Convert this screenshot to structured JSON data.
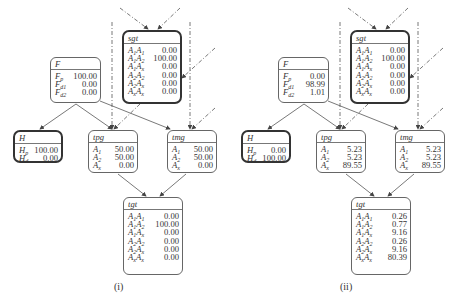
{
  "panels": [
    {
      "caption": "(i)",
      "nodes": {
        "sgt": {
          "title": "sgt",
          "rows": [
            {
              "k": "A",
              "s1": "1",
              "k2": "A",
              "s2": "1",
              "v": "0.00"
            },
            {
              "k": "A",
              "s1": "1",
              "k2": "A",
              "s2": "2",
              "v": "100.00"
            },
            {
              "k": "A",
              "s1": "1",
              "k2": "A",
              "s2": "x",
              "v": "0.00"
            },
            {
              "k": "A",
              "s1": "2",
              "k2": "A",
              "s2": "2",
              "v": "0.00"
            },
            {
              "k": "A",
              "s1": "2",
              "k2": "A",
              "s2": "x",
              "v": "0.00"
            },
            {
              "k": "A",
              "s1": "x",
              "k2": "A",
              "s2": "x",
              "v": "0.00"
            }
          ]
        },
        "F": {
          "title": "F",
          "rows": [
            {
              "k": "F",
              "s1": "p",
              "v": "100.00"
            },
            {
              "k": "F",
              "s1": "d1",
              "v": "0.00"
            },
            {
              "k": "F",
              "s1": "d2",
              "v": "0.00"
            }
          ]
        },
        "H": {
          "title": "H",
          "rows": [
            {
              "k": "H",
              "s1": "p",
              "v": "100.00"
            },
            {
              "k": "H",
              "s1": "d",
              "v": "0.00"
            }
          ]
        },
        "tpg": {
          "title": "tpg",
          "rows": [
            {
              "k": "A",
              "s1": "1",
              "v": "50.00"
            },
            {
              "k": "A",
              "s1": "2",
              "v": "50.00"
            },
            {
              "k": "A",
              "s1": "x",
              "v": "0.00"
            }
          ]
        },
        "tmg": {
          "title": "tmg",
          "rows": [
            {
              "k": "A",
              "s1": "1",
              "v": "50.00"
            },
            {
              "k": "A",
              "s1": "2",
              "v": "50.00"
            },
            {
              "k": "A",
              "s1": "x",
              "v": "0.00"
            }
          ]
        },
        "tgt": {
          "title": "tgt",
          "rows": [
            {
              "k": "A",
              "s1": "1",
              "k2": "A",
              "s2": "1",
              "v": "0.00"
            },
            {
              "k": "A",
              "s1": "1",
              "k2": "A",
              "s2": "2",
              "v": "100.00"
            },
            {
              "k": "A",
              "s1": "1",
              "k2": "A",
              "s2": "x",
              "v": "0.00"
            },
            {
              "k": "A",
              "s1": "2",
              "k2": "A",
              "s2": "2",
              "v": "0.00"
            },
            {
              "k": "A",
              "s1": "2",
              "k2": "A",
              "s2": "x",
              "v": "0.00"
            },
            {
              "k": "A",
              "s1": "x",
              "k2": "A",
              "s2": "x",
              "v": "0.00"
            }
          ]
        }
      }
    },
    {
      "caption": "(ii)",
      "nodes": {
        "sgt": {
          "title": "sgt",
          "rows": [
            {
              "k": "A",
              "s1": "1",
              "k2": "A",
              "s2": "1",
              "v": "0.00"
            },
            {
              "k": "A",
              "s1": "1",
              "k2": "A",
              "s2": "2",
              "v": "100.00"
            },
            {
              "k": "A",
              "s1": "1",
              "k2": "A",
              "s2": "x",
              "v": "0.00"
            },
            {
              "k": "A",
              "s1": "2",
              "k2": "A",
              "s2": "2",
              "v": "0.00"
            },
            {
              "k": "A",
              "s1": "2",
              "k2": "A",
              "s2": "x",
              "v": "0.00"
            },
            {
              "k": "A",
              "s1": "x",
              "k2": "A",
              "s2": "x",
              "v": "0.00"
            }
          ]
        },
        "F": {
          "title": "F",
          "rows": [
            {
              "k": "F",
              "s1": "p",
              "v": "0.00"
            },
            {
              "k": "F",
              "s1": "d1",
              "v": "98.99"
            },
            {
              "k": "F",
              "s1": "d2",
              "v": "1.01"
            }
          ]
        },
        "H": {
          "title": "H",
          "rows": [
            {
              "k": "H",
              "s1": "p",
              "v": "0.00"
            },
            {
              "k": "H",
              "s1": "d",
              "v": "100.00"
            }
          ]
        },
        "tpg": {
          "title": "tpg",
          "rows": [
            {
              "k": "A",
              "s1": "1",
              "v": "5.23"
            },
            {
              "k": "A",
              "s1": "2",
              "v": "5.23"
            },
            {
              "k": "A",
              "s1": "x",
              "v": "89.55"
            }
          ]
        },
        "tmg": {
          "title": "tmg",
          "rows": [
            {
              "k": "A",
              "s1": "1",
              "v": "5.23"
            },
            {
              "k": "A",
              "s1": "2",
              "v": "5.23"
            },
            {
              "k": "A",
              "s1": "x",
              "v": "89.55"
            }
          ]
        },
        "tgt": {
          "title": "tgt",
          "rows": [
            {
              "k": "A",
              "s1": "1",
              "k2": "A",
              "s2": "1",
              "v": "0.26"
            },
            {
              "k": "A",
              "s1": "1",
              "k2": "A",
              "s2": "2",
              "v": "0.77"
            },
            {
              "k": "A",
              "s1": "1",
              "k2": "A",
              "s2": "x",
              "v": "9.16"
            },
            {
              "k": "A",
              "s1": "2",
              "k2": "A",
              "s2": "2",
              "v": "0.26"
            },
            {
              "k": "A",
              "s1": "2",
              "k2": "A",
              "s2": "x",
              "v": "9.16"
            },
            {
              "k": "A",
              "s1": "x",
              "k2": "A",
              "s2": "x",
              "v": "80.39"
            }
          ]
        }
      }
    }
  ]
}
